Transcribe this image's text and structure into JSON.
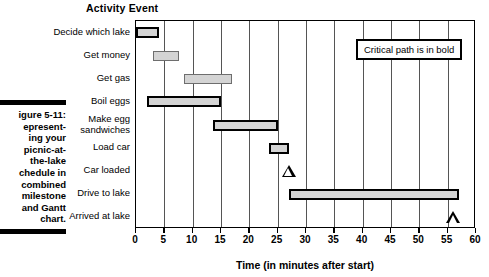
{
  "figure": {
    "caption_title": "igure 5-11:",
    "caption_body": "Representing your picnic-at-the-lake schedule in combined milestone and Gantt chart.",
    "caption_lines": [
      "igure 5-11:",
      "epresent-",
      "ing your",
      "picnic-at-",
      "the-lake",
      "chedule in",
      "combined",
      "milestone",
      "and Gantt",
      "chart."
    ]
  },
  "chart_data": {
    "type": "bar",
    "title": "Activity Event",
    "xlabel": "Time (in minutes after start)",
    "ylabel": "Activity Event",
    "xlim": [
      0,
      60
    ],
    "xticks": [
      0,
      5,
      10,
      15,
      20,
      25,
      30,
      35,
      40,
      45,
      50,
      55,
      60
    ],
    "grid": true,
    "legend_note": "Critical path is in bold",
    "categories": [
      "Decide which lake",
      "Get money",
      "Get gas",
      "Boil eggs",
      "Make egg sandwiches",
      "Load car",
      "Car loaded",
      "Drive to lake",
      "Arrived at lake"
    ],
    "tasks": [
      {
        "label": "Decide which lake",
        "kind": "bar",
        "start": 0,
        "end": 4,
        "critical": true
      },
      {
        "label": "Get money",
        "kind": "bar",
        "start": 3,
        "end": 7.5,
        "critical": false
      },
      {
        "label": "Get gas",
        "kind": "bar",
        "start": 8.5,
        "end": 17,
        "critical": false
      },
      {
        "label": "Boil eggs",
        "kind": "bar",
        "start": 2,
        "end": 15,
        "critical": true
      },
      {
        "label": "Make egg sandwiches",
        "kind": "bar",
        "start": 13.5,
        "end": 25,
        "critical": true
      },
      {
        "label": "Load car",
        "kind": "bar",
        "start": 23.5,
        "end": 27,
        "critical": true
      },
      {
        "label": "Car loaded",
        "kind": "milestone",
        "at": 27,
        "critical": true
      },
      {
        "label": "Drive to lake",
        "kind": "bar",
        "start": 27,
        "end": 57,
        "critical": true
      },
      {
        "label": "Arrived at lake",
        "kind": "milestone",
        "at": 56,
        "critical": true
      }
    ]
  },
  "colors": {
    "bar_fill": "#d4d4d4",
    "bar_border_normal": "#6e6e6e",
    "bar_border_critical": "#000000",
    "axis": "#000000",
    "gridline": "#555555",
    "background": "#ffffff"
  }
}
